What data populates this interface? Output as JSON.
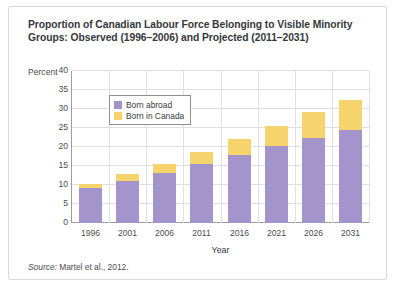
{
  "figure": {
    "title": "Proportion of Canadian Labour Force Belonging to Visible Minority Groups: Observed (1996–2006) and Projected (2011–2031)",
    "percent_axis_label": "Percent",
    "source_prefix": "Source:",
    "source_text": "Martel et al., 2012.",
    "colors": {
      "born_abroad": "#a394cb",
      "born_in_canada": "#f6d36d",
      "grid": "#dfe0e2",
      "axis": "#9b9ea1",
      "frame": "#d9dad8",
      "text": "#35383c"
    }
  },
  "chart_data": {
    "type": "bar",
    "stacked": true,
    "title": "Proportion of Canadian Labour Force Belonging to Visible Minority Groups: Observed (1996–2006) and Projected (2011–2031)",
    "xlabel": "Year",
    "ylabel": "Percent",
    "ylim": [
      0,
      40
    ],
    "yticks": [
      0,
      5,
      10,
      15,
      20,
      25,
      30,
      35,
      40
    ],
    "grid": true,
    "legend_position": "upper left inside",
    "categories": [
      "1996",
      "2001",
      "2006",
      "2011",
      "2016",
      "2021",
      "2026",
      "2031"
    ],
    "series": [
      {
        "name": "Born abroad",
        "color": "#a394cb",
        "values": [
          9.3,
          11.1,
          13.1,
          15.4,
          17.8,
          20.2,
          22.5,
          24.5
        ]
      },
      {
        "name": "Born in Canada",
        "color": "#f6d36d",
        "values": [
          1.1,
          1.8,
          2.4,
          3.4,
          4.4,
          5.4,
          6.7,
          7.8
        ]
      }
    ],
    "totals": [
      10.4,
      12.9,
      15.5,
      18.8,
      22.2,
      25.6,
      29.2,
      32.3
    ]
  }
}
